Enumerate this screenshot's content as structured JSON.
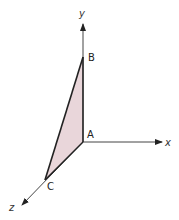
{
  "diagram": {
    "type": "3d-axes-triangle",
    "axes": {
      "x": {
        "label": "x"
      },
      "y": {
        "label": "y"
      },
      "z": {
        "label": "z"
      }
    },
    "points": {
      "A": {
        "label": "A"
      },
      "B": {
        "label": "B"
      },
      "C": {
        "label": "C"
      }
    },
    "colors": {
      "fill": "#e9d6da",
      "stroke": "#222222",
      "axis": "#333333"
    }
  }
}
